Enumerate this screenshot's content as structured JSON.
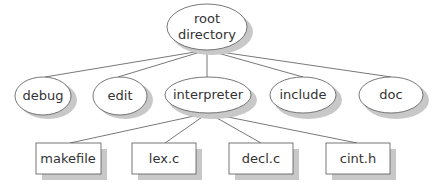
{
  "diagram": {
    "type": "directory-tree",
    "root": {
      "id": "root",
      "label_lines": [
        "root",
        "directory"
      ],
      "shape": "ellipse"
    },
    "level1": [
      {
        "id": "debug",
        "label": "debug",
        "shape": "ellipse"
      },
      {
        "id": "edit",
        "label": "edit",
        "shape": "ellipse"
      },
      {
        "id": "interpreter",
        "label": "interpreter",
        "shape": "ellipse"
      },
      {
        "id": "include",
        "label": "include",
        "shape": "ellipse"
      },
      {
        "id": "doc",
        "label": "doc",
        "shape": "ellipse"
      }
    ],
    "level2": [
      {
        "id": "makefile",
        "label": "makefile",
        "shape": "rectangle",
        "parent": "interpreter"
      },
      {
        "id": "lex_c",
        "label": "lex.c",
        "shape": "rectangle",
        "parent": "interpreter"
      },
      {
        "id": "decl_c",
        "label": "decl.c",
        "shape": "rectangle",
        "parent": "interpreter"
      },
      {
        "id": "cint_h",
        "label": "cint.h",
        "shape": "rectangle",
        "parent": "interpreter"
      }
    ],
    "edges": [
      [
        "root",
        "debug"
      ],
      [
        "root",
        "edit"
      ],
      [
        "root",
        "interpreter"
      ],
      [
        "root",
        "include"
      ],
      [
        "root",
        "doc"
      ],
      [
        "interpreter",
        "makefile"
      ],
      [
        "interpreter",
        "lex_c"
      ],
      [
        "interpreter",
        "decl_c"
      ],
      [
        "interpreter",
        "cint_h"
      ]
    ]
  }
}
